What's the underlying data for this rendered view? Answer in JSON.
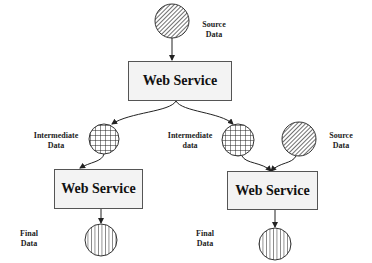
{
  "diagram": {
    "boxes": [
      {
        "id": "ws-top",
        "label": "Web Service"
      },
      {
        "id": "ws-left",
        "label": "Web Service"
      },
      {
        "id": "ws-right",
        "label": "Web Service"
      }
    ],
    "labels": {
      "source_top": [
        "Source",
        "Data"
      ],
      "intermediate_left": [
        "Intermediate",
        "Data"
      ],
      "intermediate_right": [
        "Intermediate",
        "data"
      ],
      "source_right": [
        "Source",
        "Data"
      ],
      "final_left": [
        "Final",
        "Data"
      ],
      "final_right": [
        "Final",
        "Data"
      ]
    },
    "colors": {
      "stroke": "#222222",
      "box_fill": "#f3f3f3"
    }
  }
}
